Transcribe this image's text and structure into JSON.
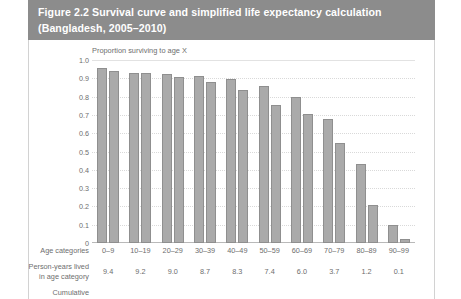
{
  "figure": {
    "title_line1": "Figure 2.2 Survival curve and simplified life expectancy calculation",
    "title_line2": "(Bangladesh, 2005–2010)",
    "header_color": "#8c8c8c",
    "bar_color": "#aaaaaa"
  },
  "rows": {
    "age_categories_label": "Age categories",
    "person_years_label_line1": "Person-years lived",
    "person_years_label_line2": "in age category",
    "cumulative_label": "Cumulative"
  },
  "chart_data": {
    "type": "bar",
    "title": "",
    "ylabel": "Proportion surviving to age X",
    "xlabel": "",
    "ylim": [
      0,
      1.0
    ],
    "grid": true,
    "legend": "none",
    "categories": [
      "0–9",
      "10–19",
      "20–29",
      "30–39",
      "40–49",
      "50–59",
      "60–69",
      "70–79",
      "80–89",
      "90–99"
    ],
    "ytick_labels": [
      "1.0",
      "0.9",
      "0.8",
      "0.7",
      "0.6",
      "0.5",
      "0.4",
      "0.3",
      "0.2",
      "0.1",
      "0"
    ],
    "ytick_values": [
      1.0,
      0.9,
      0.8,
      0.7,
      0.6,
      0.5,
      0.4,
      0.3,
      0.2,
      0.1,
      0
    ],
    "bars_per_category": 2,
    "series": [
      {
        "name": "Proportion surviving at start of interval",
        "values": [
          0.955,
          0.93,
          0.925,
          0.91,
          0.895,
          0.86,
          0.8,
          0.675,
          0.43,
          0.1
        ]
      },
      {
        "name": "Proportion surviving at end of interval",
        "values": [
          0.94,
          0.928,
          0.905,
          0.88,
          0.835,
          0.755,
          0.705,
          0.545,
          0.21,
          0.02
        ]
      }
    ],
    "person_years_lived": [
      "9.4",
      "9.2",
      "9.0",
      "8.7",
      "8.3",
      "7.4",
      "6.0",
      "3.7",
      "1.2",
      "0.1"
    ]
  }
}
